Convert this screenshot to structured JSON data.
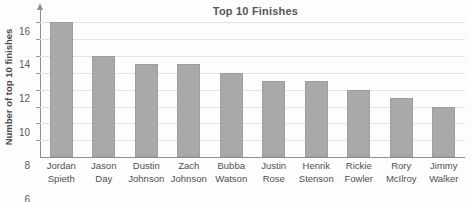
{
  "chart_data": {
    "type": "bar",
    "title": "Top 10 Finishes",
    "xlabel": "",
    "ylabel": "Number of top 10 finishes",
    "categories": [
      "Jordan Spieth",
      "Jason Day",
      "Dustin Johnson",
      "Zach Johnson",
      "Bubba Watson",
      "Justin Rose",
      "Henrik Stenson",
      "Rickie Fowler",
      "Rory McIlroy",
      "Jimmy Walker"
    ],
    "category_lines": [
      [
        "Jordan",
        "Spieth"
      ],
      [
        "Jason",
        "Day"
      ],
      [
        "Dustin",
        "Johnson"
      ],
      [
        "Zach",
        "Johnson"
      ],
      [
        "Bubba",
        "Watson"
      ],
      [
        "Justin",
        "Rose"
      ],
      [
        "Henrik",
        "Stenson"
      ],
      [
        "Rickie",
        "Fowler"
      ],
      [
        "Rory",
        "McIlroy"
      ],
      [
        "Jimmy",
        "Walker"
      ]
    ],
    "values": [
      16,
      12,
      11,
      11,
      10,
      9,
      9,
      8,
      7,
      6
    ],
    "ylim": [
      0,
      17
    ],
    "yticks": [
      2,
      4,
      6,
      8,
      10,
      12,
      14,
      16
    ],
    "grid": true,
    "legend": null,
    "bar_color": "#a9a9a9",
    "grid_color": "#e3e3e3",
    "axis_color": "#8f8f8f",
    "text_color": "#4f4f4f"
  }
}
